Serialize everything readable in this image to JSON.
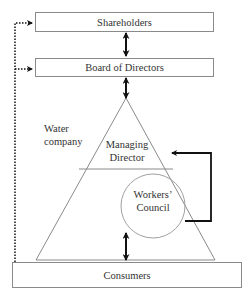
{
  "diagram": {
    "shareholders": {
      "label": "Shareholders"
    },
    "board": {
      "label": "Board of Directors"
    },
    "company": {
      "line1": "Water",
      "line2": "company"
    },
    "managing_director": {
      "line1": "Managing",
      "line2": "Director"
    },
    "workers_council": {
      "line1": "Workers’",
      "line2": "Council"
    },
    "consumers": {
      "label": "Consumers"
    }
  },
  "colors": {
    "stroke": "#8a8a8a",
    "arrow": "#111111",
    "text": "#333333"
  }
}
